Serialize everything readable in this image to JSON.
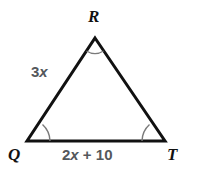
{
  "figure": {
    "type": "triangle-diagram",
    "background_color": "#ffffff",
    "stroke_color": "#111111",
    "stroke_width": 3,
    "arc_color": "#7a7a7a",
    "label_color_vertex": "#111111",
    "label_color_side": "#54585c",
    "vertices": [
      {
        "name": "R",
        "label": "R",
        "x": 95,
        "y": 38,
        "position": "apex-top"
      },
      {
        "name": "Q",
        "label": "Q",
        "x": 27,
        "y": 141,
        "position": "bottom-left"
      },
      {
        "name": "T",
        "label": "T",
        "x": 165,
        "y": 141,
        "position": "bottom-right"
      }
    ],
    "sides": [
      {
        "name": "QR",
        "label": "3x",
        "label_parts": {
          "coefficient": "3",
          "variable": "x"
        }
      },
      {
        "name": "QT",
        "label": "2x + 10",
        "label_parts": {
          "coefficient": "2",
          "variable": "x",
          "operator": "+",
          "constant": "10"
        }
      },
      {
        "name": "RT",
        "label": ""
      }
    ],
    "angle_marks": [
      {
        "vertex": "R",
        "arcs": 1
      },
      {
        "vertex": "Q",
        "arcs": 1
      },
      {
        "vertex": "T",
        "arcs": 1
      }
    ]
  }
}
